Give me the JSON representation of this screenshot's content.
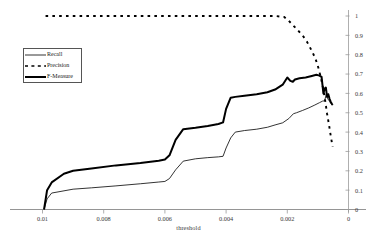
{
  "chart_data": {
    "type": "line",
    "title": "",
    "xlabel": "threshold",
    "ylabel": "",
    "xlim": [
      0.01,
      0
    ],
    "ylim": [
      0,
      1
    ],
    "x_reversed": true,
    "grid": false,
    "y_axis_position": "right",
    "legend_position": "upper-left-inside",
    "xticks": [
      0.01,
      0.008,
      0.006,
      0.004,
      0.002,
      0
    ],
    "xtick_labels": [
      "0.01",
      "0.008",
      "0.006",
      "0.004",
      "0.002",
      "0"
    ],
    "yticks": [
      0,
      0.1,
      0.2,
      0.3,
      0.4,
      0.5,
      0.6,
      0.7,
      0.8,
      0.9,
      1
    ],
    "ytick_labels": [
      "0",
      "0.1",
      "0.2",
      "0.3",
      "0.4",
      "0.5",
      "0.6",
      "0.7",
      "0.8",
      "0.9",
      "1"
    ],
    "series": [
      {
        "name": "Recall",
        "style": "solid-thin",
        "color": "#000000",
        "x": [
          0.00995,
          0.00985,
          0.0097,
          0.009,
          0.0084,
          0.0076,
          0.0068,
          0.0062,
          0.006,
          0.00585,
          0.00565,
          0.0054,
          0.005,
          0.0046,
          0.00425,
          0.0041,
          0.004,
          0.00385,
          0.0037,
          0.0034,
          0.003,
          0.00265,
          0.0024,
          0.00215,
          0.00195,
          0.0018,
          0.0017,
          0.0015,
          0.0013,
          0.0011,
          0.00095,
          0.00085,
          0.00078,
          0.00072,
          0.00068,
          0.00062,
          0.00058,
          0.00052
        ],
        "y": [
          0.0,
          0.055,
          0.085,
          0.105,
          0.112,
          0.122,
          0.133,
          0.142,
          0.145,
          0.16,
          0.205,
          0.25,
          0.262,
          0.268,
          0.272,
          0.275,
          0.318,
          0.37,
          0.4,
          0.408,
          0.415,
          0.425,
          0.437,
          0.448,
          0.47,
          0.495,
          0.5,
          0.512,
          0.525,
          0.54,
          0.552,
          0.56,
          0.562,
          0.6,
          0.572,
          0.56,
          0.548,
          0.54
        ]
      },
      {
        "name": "Precision",
        "style": "dashed",
        "color": "#000000",
        "x": [
          0.0099,
          0.009,
          0.008,
          0.007,
          0.006,
          0.005,
          0.004,
          0.003,
          0.0024,
          0.0021,
          0.00195,
          0.0018,
          0.00165,
          0.0015,
          0.00135,
          0.0012,
          0.00108,
          0.00098,
          0.0009,
          0.00082,
          0.00076,
          0.0007,
          0.00064,
          0.00058,
          0.00052
        ],
        "y": [
          1.0,
          1.0,
          1.0,
          1.0,
          1.0,
          1.0,
          1.0,
          1.0,
          1.0,
          0.995,
          0.975,
          0.95,
          0.925,
          0.9,
          0.865,
          0.82,
          0.78,
          0.73,
          0.68,
          0.62,
          0.56,
          0.495,
          0.44,
          0.38,
          0.325
        ]
      },
      {
        "name": "F-Measure",
        "style": "solid-thick",
        "color": "#000000",
        "x": [
          0.00995,
          0.00985,
          0.0097,
          0.0093,
          0.009,
          0.0084,
          0.0076,
          0.0068,
          0.0062,
          0.006,
          0.00585,
          0.00565,
          0.0054,
          0.005,
          0.0046,
          0.00425,
          0.0041,
          0.004,
          0.00385,
          0.0037,
          0.0034,
          0.003,
          0.00265,
          0.0024,
          0.00215,
          0.002,
          0.0019,
          0.00182,
          0.00175,
          0.0016,
          0.0014,
          0.0012,
          0.00105,
          0.00095,
          0.00088,
          0.00082,
          0.00078,
          0.00074,
          0.0007,
          0.00066,
          0.00062,
          0.00058,
          0.00054,
          0.00052
        ],
        "y": [
          0.0,
          0.1,
          0.14,
          0.185,
          0.2,
          0.212,
          0.228,
          0.24,
          0.252,
          0.258,
          0.28,
          0.36,
          0.415,
          0.422,
          0.432,
          0.442,
          0.45,
          0.52,
          0.578,
          0.582,
          0.588,
          0.596,
          0.606,
          0.62,
          0.645,
          0.682,
          0.665,
          0.66,
          0.672,
          0.678,
          0.682,
          0.69,
          0.696,
          0.692,
          0.685,
          0.6,
          0.625,
          0.63,
          0.582,
          0.596,
          0.572,
          0.556,
          0.545,
          0.54
        ]
      }
    ]
  },
  "legend": {
    "items": [
      {
        "label": "Recall",
        "style": "solid-thin"
      },
      {
        "label": "Precision",
        "style": "dashed"
      },
      {
        "label": "F-Measure",
        "style": "solid-thick"
      }
    ]
  },
  "axes": {
    "x_title": "threshold"
  }
}
